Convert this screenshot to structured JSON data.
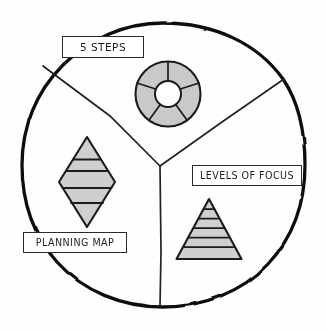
{
  "diagram": {
    "style": "hand-drawn sketch, black ink on white paper",
    "colors": {
      "ink": "#1d1d1d",
      "outer_circle_stroke": "#111111",
      "divider_stroke": "#222222",
      "shape_fill": "#c9c9c9",
      "shape_fill_light": "#d6d6d6",
      "hole_fill": "#ffffff",
      "paper": "#fefefe",
      "label_box_fill": "#ffffff",
      "label_box_border": "#2a2a2a"
    },
    "outer_circle": {
      "name": "outer-circle",
      "center_x": 163,
      "center_y": 165,
      "radius": 142,
      "stroke_width": 3.2
    },
    "center_junction": {
      "x": 160,
      "y": 166
    },
    "sectors": [
      {
        "id": "top",
        "name": "sector-top",
        "label": "5 STEPS",
        "icon": "donut-chart-icon",
        "icon_description": "donut / pie ring divided into 5 equal segments with a hollow white center"
      },
      {
        "id": "bottom-right",
        "name": "sector-bottom-right",
        "label": "LEVELS OF FOCUS",
        "icon": "pyramid-icon",
        "icon_description": "triangle pyramid divided into 6 horizontal levels"
      },
      {
        "id": "left",
        "name": "sector-left",
        "label": "PLANNING MAP",
        "icon": "diamond-icon",
        "icon_description": "vertical rhombus / diamond divided into 4 horizontal bands"
      }
    ],
    "labels": {
      "five_steps": "5 STEPS",
      "levels_of_focus": "LEVELS OF FOCUS",
      "planning_map": "PLANNING MAP"
    },
    "icons": {
      "donut": {
        "name": "donut-chart-icon",
        "center_x": 168,
        "center_y": 94,
        "outer_radius": 33,
        "inner_radius": 13,
        "segments": 5
      },
      "diamond": {
        "name": "diamond-icon",
        "center_x": 87,
        "center_y": 182,
        "half_width": 28,
        "half_height": 45,
        "bands": 4
      },
      "pyramid": {
        "name": "pyramid-icon",
        "apex_x": 209,
        "apex_y": 200,
        "base_left_x": 177,
        "base_right_x": 241,
        "base_y": 259,
        "levels": 6
      }
    }
  }
}
